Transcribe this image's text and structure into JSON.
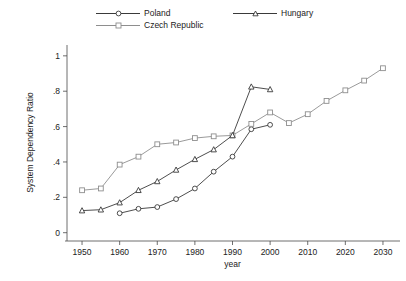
{
  "chart_data": {
    "type": "line",
    "title": "",
    "xlabel": "year",
    "ylabel": "System Dependency Ratio",
    "xlim": [
      1946,
      2034
    ],
    "ylim": [
      -0.03,
      1.05
    ],
    "xticks": [
      1950,
      1960,
      1970,
      1980,
      1990,
      2000,
      2010,
      2020,
      2030
    ],
    "yticks": [
      0,
      0.2,
      0.4,
      0.6,
      0.8,
      1
    ],
    "ytick_labels": [
      "0",
      ".2",
      ".4",
      ".6",
      ".8",
      "1"
    ],
    "xtick_labels": [
      "1950",
      "1960",
      "1970",
      "1980",
      "1990",
      "2000",
      "2010",
      "2020",
      "2030"
    ],
    "grid": false,
    "legend_position": "top",
    "series": [
      {
        "name": "Poland",
        "marker": "circle",
        "color": "#3a3a3a",
        "x": [
          1960,
          1965,
          1970,
          1975,
          1980,
          1985,
          1990,
          1995,
          2000
        ],
        "values": [
          0.11,
          0.135,
          0.145,
          0.19,
          0.25,
          0.345,
          0.43,
          0.585,
          0.61
        ]
      },
      {
        "name": "Czech Republic",
        "marker": "square",
        "color": "#8e8e8e",
        "x": [
          1950,
          1955,
          1960,
          1965,
          1970,
          1975,
          1980,
          1985,
          1990,
          1995,
          2000,
          2005,
          2010,
          2015,
          2020,
          2025,
          2030
        ],
        "values": [
          0.24,
          0.25,
          0.385,
          0.43,
          0.5,
          0.51,
          0.535,
          0.545,
          0.55,
          0.615,
          0.68,
          0.62,
          0.67,
          0.745,
          0.805,
          0.86,
          0.93
        ]
      },
      {
        "name": "Hungary",
        "marker": "triangle",
        "color": "#3a3a3a",
        "x": [
          1950,
          1955,
          1960,
          1965,
          1970,
          1975,
          1980,
          1985,
          1990,
          1995,
          2000
        ],
        "values": [
          0.125,
          0.13,
          0.17,
          0.24,
          0.29,
          0.355,
          0.415,
          0.47,
          0.55,
          0.825,
          0.81
        ]
      }
    ]
  },
  "legend": {
    "poland": "Poland",
    "czech": "Czech Republic",
    "hungary": "Hungary"
  },
  "axes": {
    "x_title": "year",
    "y_title": "System Dependency Ratio"
  }
}
